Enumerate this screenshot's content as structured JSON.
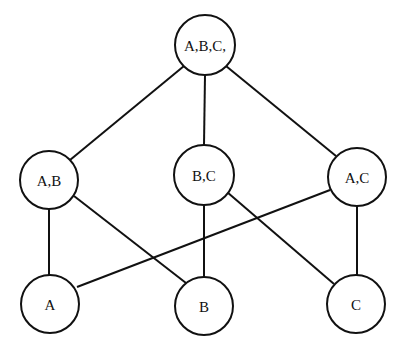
{
  "diagram": {
    "type": "lattice",
    "nodes": [
      {
        "id": "ABC",
        "label": "A,B,C,",
        "x": 205,
        "y": 45,
        "r": 30
      },
      {
        "id": "AB",
        "label": "A,B",
        "x": 49,
        "y": 180,
        "r": 29
      },
      {
        "id": "BC",
        "label": "B,C",
        "x": 204,
        "y": 175,
        "r": 30
      },
      {
        "id": "AC",
        "label": "A,C",
        "x": 357,
        "y": 177,
        "r": 29
      },
      {
        "id": "A",
        "label": "A",
        "x": 50,
        "y": 304,
        "r": 29
      },
      {
        "id": "B",
        "label": "B",
        "x": 204,
        "y": 306,
        "r": 29
      },
      {
        "id": "C",
        "label": "C",
        "x": 356,
        "y": 304,
        "r": 29
      }
    ],
    "edges": [
      [
        "ABC",
        "AB"
      ],
      [
        "ABC",
        "BC"
      ],
      [
        "ABC",
        "AC"
      ],
      [
        "AB",
        "A"
      ],
      [
        "AB",
        "B"
      ],
      [
        "BC",
        "B"
      ],
      [
        "BC",
        "C"
      ],
      [
        "AC",
        "A"
      ],
      [
        "AC",
        "C"
      ]
    ]
  }
}
